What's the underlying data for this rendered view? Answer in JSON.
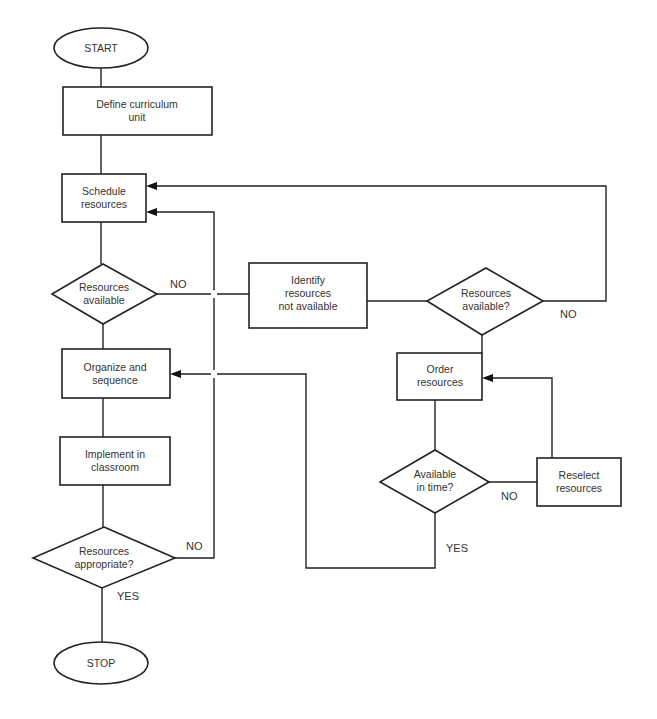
{
  "flowchart": {
    "nodes": {
      "start": {
        "type": "terminal",
        "lines": [
          "START"
        ]
      },
      "define": {
        "type": "process",
        "lines": [
          "Define curriculum",
          "unit"
        ]
      },
      "schedule": {
        "type": "process",
        "lines": [
          "Schedule",
          "resources"
        ]
      },
      "avail1": {
        "type": "decision",
        "lines": [
          "Resources",
          "available"
        ]
      },
      "organize": {
        "type": "process",
        "lines": [
          "Organize and",
          "sequence"
        ]
      },
      "implement": {
        "type": "process",
        "lines": [
          "Implement in",
          "classroom"
        ]
      },
      "appropriate": {
        "type": "decision",
        "lines": [
          "Resources",
          "appropriate?"
        ]
      },
      "stop": {
        "type": "terminal",
        "lines": [
          "STOP"
        ]
      },
      "identify": {
        "type": "process",
        "lines": [
          "Identify",
          "resources",
          "not available"
        ]
      },
      "avail2": {
        "type": "decision",
        "lines": [
          "Resources",
          "available?"
        ]
      },
      "order": {
        "type": "process",
        "lines": [
          "Order",
          "resources"
        ]
      },
      "intime": {
        "type": "decision",
        "lines": [
          "Available",
          "in time?"
        ]
      },
      "reselect": {
        "type": "process",
        "lines": [
          "Reselect",
          "resources"
        ]
      }
    },
    "edges": [
      {
        "from": "start",
        "to": "define",
        "label": ""
      },
      {
        "from": "define",
        "to": "schedule",
        "label": ""
      },
      {
        "from": "schedule",
        "to": "avail1",
        "label": ""
      },
      {
        "from": "avail1",
        "to": "organize",
        "label": ""
      },
      {
        "from": "avail1",
        "to": "identify",
        "label": "NO"
      },
      {
        "from": "organize",
        "to": "implement",
        "label": ""
      },
      {
        "from": "implement",
        "to": "appropriate",
        "label": ""
      },
      {
        "from": "appropriate",
        "to": "schedule",
        "label": "NO"
      },
      {
        "from": "appropriate",
        "to": "stop",
        "label": "YES"
      },
      {
        "from": "identify",
        "to": "avail2",
        "label": ""
      },
      {
        "from": "avail2",
        "to": "schedule",
        "label": "NO"
      },
      {
        "from": "avail2",
        "to": "order",
        "label": ""
      },
      {
        "from": "order",
        "to": "intime",
        "label": ""
      },
      {
        "from": "intime",
        "to": "reselect",
        "label": "NO"
      },
      {
        "from": "reselect",
        "to": "order",
        "label": ""
      },
      {
        "from": "intime",
        "to": "organize",
        "label": "YES"
      }
    ],
    "labels": {
      "no_avail1": "NO",
      "no_appropriate": "NO",
      "yes_appropriate": "YES",
      "no_avail2": "NO",
      "no_intime": "NO",
      "yes_intime": "YES"
    }
  }
}
